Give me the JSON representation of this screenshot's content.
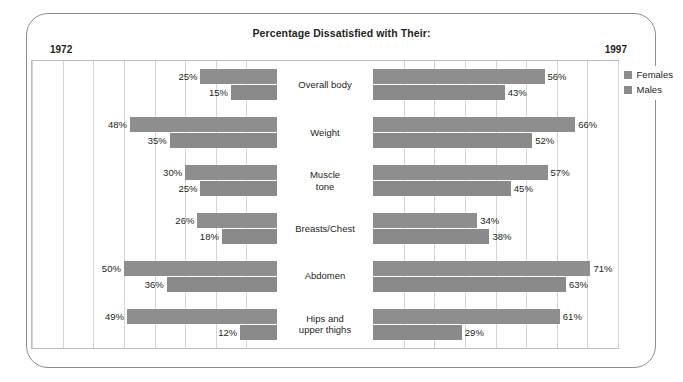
{
  "title": "Percentage Dissatisfied with Their:",
  "year_left": "1972",
  "year_right": "1997",
  "legend": {
    "females": "Females",
    "males": "Males",
    "female_color": "#8e8e8e",
    "male_color": "#8a8a8a"
  },
  "chart_data": {
    "type": "bar",
    "title": "Percentage Dissatisfied with Their:",
    "subtype": "bidirectional-butterfly",
    "xlabel": "",
    "ylabel": "",
    "grid": true,
    "grid_step": 10,
    "legend_position": "right",
    "axis_max": 80,
    "panels": [
      {
        "name": "1972",
        "direction": "left"
      },
      {
        "name": "1997",
        "direction": "right"
      }
    ],
    "categories": [
      "Overall body",
      "Weight",
      "Muscle tone",
      "Breasts/Chest",
      "Abdomen",
      "Hips and upper thighs"
    ],
    "series": [
      {
        "name": "Females",
        "panel": "1972",
        "values": [
          25,
          48,
          30,
          26,
          50,
          49
        ],
        "labels": [
          "25%",
          "48%",
          "30%",
          "26%",
          "50%",
          "49%"
        ]
      },
      {
        "name": "Males",
        "panel": "1972",
        "values": [
          15,
          35,
          25,
          18,
          36,
          12
        ],
        "labels": [
          "15%",
          "35%",
          "25%",
          "18%",
          "36%",
          "12%"
        ]
      },
      {
        "name": "Females",
        "panel": "1997",
        "values": [
          56,
          66,
          57,
          34,
          71,
          61
        ],
        "labels": [
          "56%",
          "66%",
          "57%",
          "34%",
          "71%",
          "61%"
        ]
      },
      {
        "name": "Males",
        "panel": "1997",
        "values": [
          43,
          52,
          45,
          38,
          63,
          29
        ],
        "labels": [
          "43%",
          "52%",
          "45%",
          "38%",
          "63%",
          "29%"
        ]
      }
    ]
  },
  "rows": [
    {
      "label": "Overall body",
      "label_lines": [
        "Overall body"
      ],
      "left_female": "25%",
      "left_male": "15%",
      "right_female": "56%",
      "right_male": "43%",
      "lf": 25,
      "lm": 15,
      "rf": 56,
      "rm": 43
    },
    {
      "label": "Weight",
      "label_lines": [
        "Weight"
      ],
      "left_female": "48%",
      "left_male": "35%",
      "right_female": "66%",
      "right_male": "52%",
      "lf": 48,
      "lm": 35,
      "rf": 66,
      "rm": 52
    },
    {
      "label": "Muscle tone",
      "label_lines": [
        "Muscle",
        "tone"
      ],
      "left_female": "30%",
      "left_male": "25%",
      "right_female": "57%",
      "right_male": "45%",
      "lf": 30,
      "lm": 25,
      "rf": 57,
      "rm": 45
    },
    {
      "label": "Breasts/Chest",
      "label_lines": [
        "Breasts/Chest"
      ],
      "left_female": "26%",
      "left_male": "18%",
      "right_female": "34%",
      "right_male": "38%",
      "lf": 26,
      "lm": 18,
      "rf": 34,
      "rm": 38
    },
    {
      "label": "Abdomen",
      "label_lines": [
        "Abdomen"
      ],
      "left_female": "50%",
      "left_male": "36%",
      "right_female": "71%",
      "right_male": "63%",
      "lf": 50,
      "lm": 36,
      "rf": 71,
      "rm": 63
    },
    {
      "label": "Hips and upper thighs",
      "label_lines": [
        "Hips and",
        "upper thighs"
      ],
      "left_female": "49%",
      "left_male": "12%",
      "right_female": "61%",
      "right_male": "29%",
      "lf": 49,
      "lm": 12,
      "rf": 61,
      "rm": 29
    }
  ]
}
